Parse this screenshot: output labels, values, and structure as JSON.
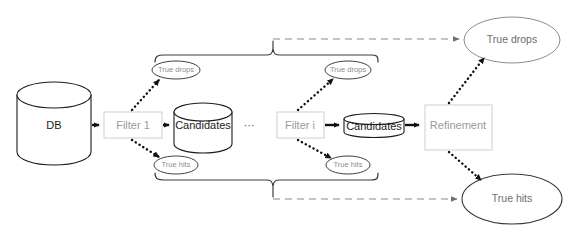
{
  "diagram": {
    "colors": {
      "stroke_dark": "#1c1c1c",
      "stroke_gray": "#cfcfcf",
      "text_gray": "#9a9a9a",
      "text_dark": "#1a1a1a",
      "dashed_gray": "#8a8a8a",
      "background": "#ffffff"
    },
    "nodes": {
      "db": {
        "label": "DB",
        "shape": "cylinder"
      },
      "filter_1": {
        "label": "Filter 1",
        "shape": "rectangle"
      },
      "candidates_1": {
        "label": "Candidates",
        "shape": "cylinder"
      },
      "ellipsis": {
        "label": "···",
        "shape": "text"
      },
      "filter_i": {
        "label": "Filter i",
        "shape": "rectangle"
      },
      "candidates_i": {
        "label": "Candidates",
        "shape": "flat-cylinder"
      },
      "refinement": {
        "label": "Refinement",
        "shape": "rectangle"
      },
      "true_drops_1": {
        "label": "True drops",
        "shape": "ellipse"
      },
      "true_hits_1": {
        "label": "True hits",
        "shape": "ellipse"
      },
      "true_drops_i": {
        "label": "True drops",
        "shape": "ellipse"
      },
      "true_hits_i": {
        "label": "True hits",
        "shape": "ellipse"
      },
      "true_drops_total": {
        "label": "True drops",
        "shape": "ellipse"
      },
      "true_hits_total": {
        "label": "True hits",
        "shape": "ellipse"
      }
    },
    "edges": [
      {
        "from": "db",
        "to": "filter_1",
        "style": "solid"
      },
      {
        "from": "filter_1",
        "to": "candidates_1",
        "style": "solid"
      },
      {
        "from": "filter_1",
        "to": "true_drops_1",
        "style": "dotted"
      },
      {
        "from": "filter_1",
        "to": "true_hits_1",
        "style": "dotted"
      },
      {
        "from": "filter_i",
        "to": "candidates_i",
        "style": "solid"
      },
      {
        "from": "filter_i",
        "to": "true_drops_i",
        "style": "dotted"
      },
      {
        "from": "filter_i",
        "to": "true_hits_i",
        "style": "dotted"
      },
      {
        "from": "candidates_i",
        "to": "refinement",
        "style": "solid"
      },
      {
        "from": "refinement",
        "to": "true_drops_total",
        "style": "dotted"
      },
      {
        "from": "refinement",
        "to": "true_hits_total",
        "style": "dotted"
      },
      {
        "from": "brace_top",
        "to": "true_drops_total",
        "style": "dashed"
      },
      {
        "from": "brace_bottom",
        "to": "true_hits_total",
        "style": "dashed"
      }
    ],
    "braces": [
      {
        "name": "drops-brace",
        "orientation": "up",
        "groups": [
          "true_drops_1",
          "true_drops_i"
        ]
      },
      {
        "name": "hits-brace",
        "orientation": "down",
        "groups": [
          "true_hits_1",
          "true_hits_i"
        ]
      }
    ]
  }
}
